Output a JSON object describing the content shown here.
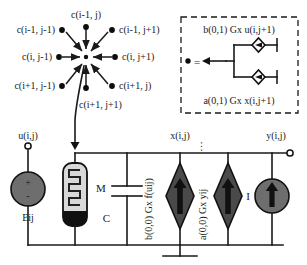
{
  "figure": {
    "accent_gray": "#6e6e6e",
    "line_color": "#1a1a1a"
  },
  "neighborhood": {
    "name": "coupling-star",
    "center_label": "",
    "spokes": [
      {
        "id": "nw",
        "label": "c(i-1, j-1)"
      },
      {
        "id": "n",
        "label": "c(i-1, j)"
      },
      {
        "id": "ne",
        "label": "c(i-1, j+1)"
      },
      {
        "id": "w",
        "label": "c(i, j-1)"
      },
      {
        "id": "e",
        "label": "c(i, j+1)"
      },
      {
        "id": "sw",
        "label": "c(i+1, j-1)"
      },
      {
        "id": "s",
        "label": "c(i+1, j)"
      },
      {
        "id": "se",
        "label": "c(i+1, j+1)"
      }
    ]
  },
  "legend_box": {
    "name": "coupling-definition",
    "equals_sign": "=",
    "dot_glyph": "●",
    "top_label": "b(0,1) Gx u(i,j+1)",
    "bottom_label": "a(0,1) Gx x(i,j+1)"
  },
  "circuit": {
    "terminals": {
      "input_label": "u(i,j)",
      "state_label": "x(i,j)",
      "output_label": "y(i,j)"
    },
    "components": [
      {
        "id": "source-e",
        "label": "Eij",
        "plus": "+",
        "minus": "-",
        "type": "voltage-source"
      },
      {
        "id": "memristor",
        "label": "M",
        "type": "memristor"
      },
      {
        "id": "capacitor",
        "label": "C",
        "type": "capacitor"
      },
      {
        "id": "ccs-b",
        "label": "b(0,0) Gx f(uij)",
        "type": "controlled-current-source"
      },
      {
        "id": "ccs-a",
        "label": "a(0,0) Gx yij",
        "type": "controlled-current-source"
      },
      {
        "id": "source-i",
        "label": "I",
        "type": "current-source"
      }
    ],
    "ellipsis": "⋯",
    "ground_label": ""
  }
}
